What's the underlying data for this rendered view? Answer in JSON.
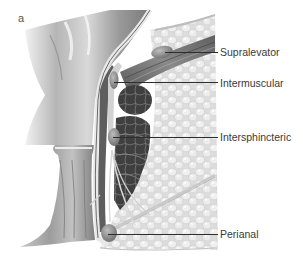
{
  "figure": {
    "panel_letter": "a",
    "labels": [
      {
        "id": "supralevator",
        "text": "Supralevator",
        "y": 46,
        "line_from_x": 165,
        "line_y": 52
      },
      {
        "id": "intermuscular",
        "text": "Intermuscular",
        "y": 77,
        "line_from_x": 114,
        "line_y": 82
      },
      {
        "id": "intersphincteric",
        "text": "Intersphincteric",
        "y": 131,
        "line_from_x": 113,
        "line_y": 137
      },
      {
        "id": "perianal",
        "text": "Perianal",
        "y": 228,
        "line_from_x": 108,
        "line_y": 234
      }
    ],
    "colors": {
      "background": "#ffffff",
      "rectum_light": "#d8d8d8",
      "rectum_mid": "#a8a8a8",
      "rectum_dark": "#6e6e6e",
      "muscle_dark": "#4a4a4a",
      "fat": "#e6e6e6",
      "abscess": "#8c8c8c",
      "leader_line": "#2d2d2d",
      "label_text": "#3a3a3a"
    }
  }
}
